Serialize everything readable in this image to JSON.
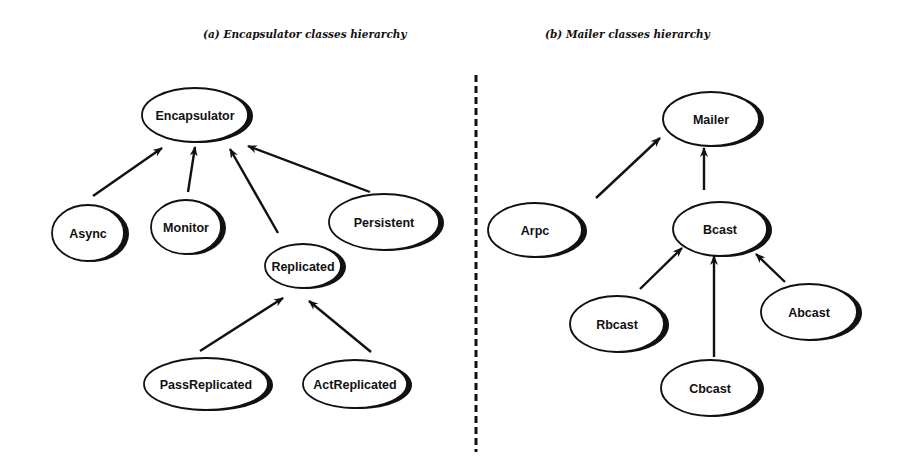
{
  "captions": {
    "left": "(a) Encapsulator classes hierarchy",
    "right": "(b) Mailer classes hierarchy"
  },
  "colors": {
    "ink": "#111111",
    "background": "#ffffff"
  },
  "divider": {
    "style": "dashed",
    "x": 476,
    "y1": 75,
    "y2": 452
  },
  "diagrams": [
    {
      "name": "encapsulator-hierarchy",
      "nodes": [
        {
          "id": "encapsulator",
          "label": "Encapsulator",
          "cx": 195,
          "cy": 115,
          "rx": 53,
          "ry": 27
        },
        {
          "id": "async",
          "label": "Async",
          "cx": 88,
          "cy": 233,
          "rx": 36,
          "ry": 28
        },
        {
          "id": "monitor",
          "label": "Monitor",
          "cx": 186,
          "cy": 227,
          "rx": 35,
          "ry": 27
        },
        {
          "id": "persistent",
          "label": "Persistent",
          "cx": 384,
          "cy": 222,
          "rx": 55,
          "ry": 28
        },
        {
          "id": "replicated",
          "label": "Replicated",
          "cx": 303,
          "cy": 266,
          "rx": 38,
          "ry": 22
        },
        {
          "id": "passreplicated",
          "label": "PassReplicated",
          "cx": 206,
          "cy": 384,
          "rx": 62,
          "ry": 26
        },
        {
          "id": "actreplicated",
          "label": "ActReplicated",
          "cx": 355,
          "cy": 384,
          "rx": 52,
          "ry": 24
        }
      ],
      "edges": [
        {
          "from": "async",
          "to": "encapsulator",
          "x1": 93,
          "y1": 196,
          "x2": 162,
          "y2": 148
        },
        {
          "from": "monitor",
          "to": "encapsulator",
          "x1": 188,
          "y1": 192,
          "x2": 195,
          "y2": 147
        },
        {
          "from": "replicated",
          "to": "encapsulator",
          "x1": 278,
          "y1": 233,
          "x2": 230,
          "y2": 149
        },
        {
          "from": "persistent",
          "to": "encapsulator",
          "x1": 370,
          "y1": 192,
          "x2": 248,
          "y2": 146
        },
        {
          "from": "passreplicated",
          "to": "replicated",
          "x1": 200,
          "y1": 351,
          "x2": 283,
          "y2": 298
        },
        {
          "from": "actreplicated",
          "to": "replicated",
          "x1": 371,
          "y1": 352,
          "x2": 309,
          "y2": 301
        }
      ]
    },
    {
      "name": "mailer-hierarchy",
      "nodes": [
        {
          "id": "mailer",
          "label": "Mailer",
          "cx": 711,
          "cy": 119,
          "rx": 48,
          "ry": 27
        },
        {
          "id": "arpc",
          "label": "Arpc",
          "cx": 535,
          "cy": 230,
          "rx": 47,
          "ry": 27
        },
        {
          "id": "bcast",
          "label": "Bcast",
          "cx": 720,
          "cy": 229,
          "rx": 47,
          "ry": 27
        },
        {
          "id": "rbcast",
          "label": "Rbcast",
          "cx": 617,
          "cy": 324,
          "rx": 47,
          "ry": 28
        },
        {
          "id": "abcast",
          "label": "Abcast",
          "cx": 809,
          "cy": 312,
          "rx": 48,
          "ry": 28
        },
        {
          "id": "cbcast",
          "label": "Cbcast",
          "cx": 710,
          "cy": 388,
          "rx": 49,
          "ry": 28
        }
      ],
      "edges": [
        {
          "from": "arpc",
          "to": "mailer",
          "x1": 596,
          "y1": 198,
          "x2": 660,
          "y2": 138
        },
        {
          "from": "bcast",
          "to": "mailer",
          "x1": 704,
          "y1": 190,
          "x2": 704,
          "y2": 148
        },
        {
          "from": "rbcast",
          "to": "bcast",
          "x1": 640,
          "y1": 289,
          "x2": 682,
          "y2": 248
        },
        {
          "from": "cbcast",
          "to": "bcast",
          "x1": 714,
          "y1": 357,
          "x2": 714,
          "y2": 256
        },
        {
          "from": "abcast",
          "to": "bcast",
          "x1": 785,
          "y1": 282,
          "x2": 756,
          "y2": 254
        }
      ]
    }
  ]
}
